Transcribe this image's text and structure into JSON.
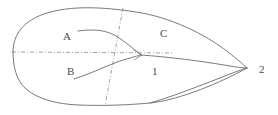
{
  "figure": {
    "type": "line-diagram",
    "width": 278,
    "height": 115,
    "background_color": "#ffffff",
    "stroke_color": "#6b6b6b",
    "axis_color": "#8a8a8a",
    "label_color": "#4a4a4a"
  },
  "labels": [
    {
      "id": "A",
      "text": "A",
      "x": 63,
      "y": 31,
      "role": "upper-vein-label"
    },
    {
      "id": "B",
      "text": "B",
      "x": 67,
      "y": 66,
      "role": "lower-vein-label"
    },
    {
      "id": "C",
      "text": "C",
      "x": 160,
      "y": 28,
      "role": "upper-region-label"
    },
    {
      "id": "1",
      "text": "1",
      "x": 152,
      "y": 66,
      "role": "node-label-one"
    },
    {
      "id": "2",
      "text": "2",
      "x": 259,
      "y": 64,
      "role": "node-label-two"
    }
  ],
  "paths": {
    "outline_upper": "M 13,52 C 13,34 24,21 44,14 C 70,5 104,7 136,12 C 170,17 205,34 228,52 C 238,60 244,65 247,68",
    "outline_lower": "M 13,52 C 13,66 16,80 26,89 C 38,99 56,104 78,105 C 104,106 128,105 150,103 C 180,100 222,82 247,68",
    "outline_inner_upper_right": "M 141,55 C 170,57 200,61 224,65 C 236,67 243,68 247,68",
    "outline_inner_lower_right": "M 150,103 C 178,95 214,80 238,71 C 243,69 246,68 247,68",
    "vein_a": "M 78,31 C 92,29 104,30 112,34 C 121,38 131,47 141,55",
    "vein_b": "M 74,79 C 90,74 106,66 120,61 C 130,58 137,56 141,55",
    "axis_horizontal": "M 12,52 L 173,53",
    "axis_diagonal": "M 123,8 L 105,106"
  },
  "line_styles": {
    "outline": "solid",
    "veins": "solid",
    "axis_horizontal": "dash-dot",
    "axis_diagonal": "dash-dot"
  }
}
